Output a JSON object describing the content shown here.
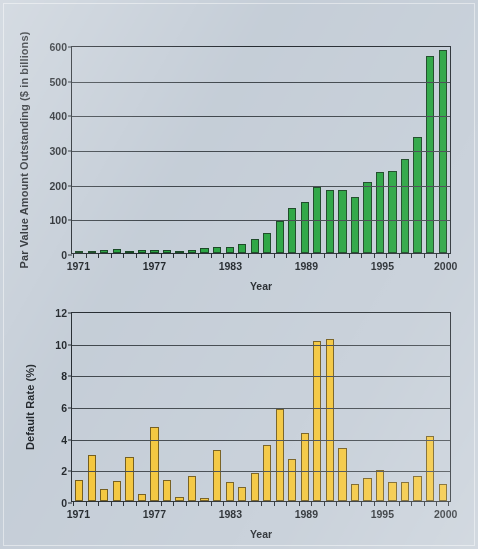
{
  "figure": {
    "background_color": "#c3ccd6",
    "green": "#21a13a",
    "yellow": "#f3c434",
    "axis_color": "#20262c"
  },
  "chart_data": [
    {
      "type": "bar",
      "id": "par-value-outstanding",
      "title": "",
      "xlabel": "Year",
      "ylabel": "Par Value Amount Outstanding ($ in billions)",
      "ylim": [
        0,
        600
      ],
      "yticks": [
        0,
        100,
        200,
        300,
        400,
        500,
        600
      ],
      "ytick_labels": [
        "0",
        "100",
        "200",
        "300",
        "400",
        "500",
        "600"
      ],
      "grid": true,
      "legend": "none",
      "bar_color": "#21a13a",
      "xtick_labels": [
        "1971",
        "1977",
        "1983",
        "1989",
        "1995",
        "2000"
      ],
      "categories": [
        "1971",
        "1972",
        "1973",
        "1974",
        "1975",
        "1976",
        "1977",
        "1978",
        "1979",
        "1980",
        "1981",
        "1982",
        "1983",
        "1984",
        "1985",
        "1986",
        "1987",
        "1988",
        "1989",
        "1990",
        "1991",
        "1992",
        "1993",
        "1994",
        "1995",
        "1996",
        "1997",
        "1998",
        "1999",
        "2000"
      ],
      "values": [
        7,
        7,
        8,
        11,
        7,
        8,
        9,
        9,
        2,
        10,
        15,
        17,
        18,
        27,
        41,
        59,
        92,
        129,
        148,
        189,
        181,
        183,
        163,
        206,
        235,
        237,
        271,
        335,
        567,
        586
      ]
    },
    {
      "type": "bar",
      "id": "default-rate",
      "title": "",
      "xlabel": "Year",
      "ylabel": "Default Rate (%)",
      "ylim": [
        0,
        12
      ],
      "yticks": [
        0,
        2,
        4,
        6,
        8,
        10,
        12
      ],
      "ytick_labels": [
        "0",
        "2",
        "4",
        "6",
        "8",
        "10",
        "12"
      ],
      "grid": true,
      "legend": "none",
      "bar_color": "#f3c434",
      "xtick_labels": [
        "1971",
        "1977",
        "1983",
        "1989",
        "1995",
        "2000"
      ],
      "categories": [
        "1971",
        "1972",
        "1973",
        "1974",
        "1975",
        "1976",
        "1977",
        "1978",
        "1979",
        "1980",
        "1981",
        "1982",
        "1983",
        "1984",
        "1985",
        "1986",
        "1987",
        "1988",
        "1989",
        "1990",
        "1991",
        "1992",
        "1993",
        "1994",
        "1995",
        "1996",
        "1997",
        "1998",
        "1999",
        "2000"
      ],
      "values": [
        1.35,
        2.9,
        0.75,
        1.25,
        2.78,
        0.47,
        4.7,
        1.35,
        0.23,
        1.55,
        0.22,
        3.22,
        1.18,
        0.9,
        1.75,
        3.52,
        5.8,
        2.65,
        4.27,
        10.12,
        10.25,
        3.35,
        1.1,
        1.45,
        1.95,
        1.2,
        1.2,
        1.55,
        4.13,
        1.1
      ]
    }
  ]
}
